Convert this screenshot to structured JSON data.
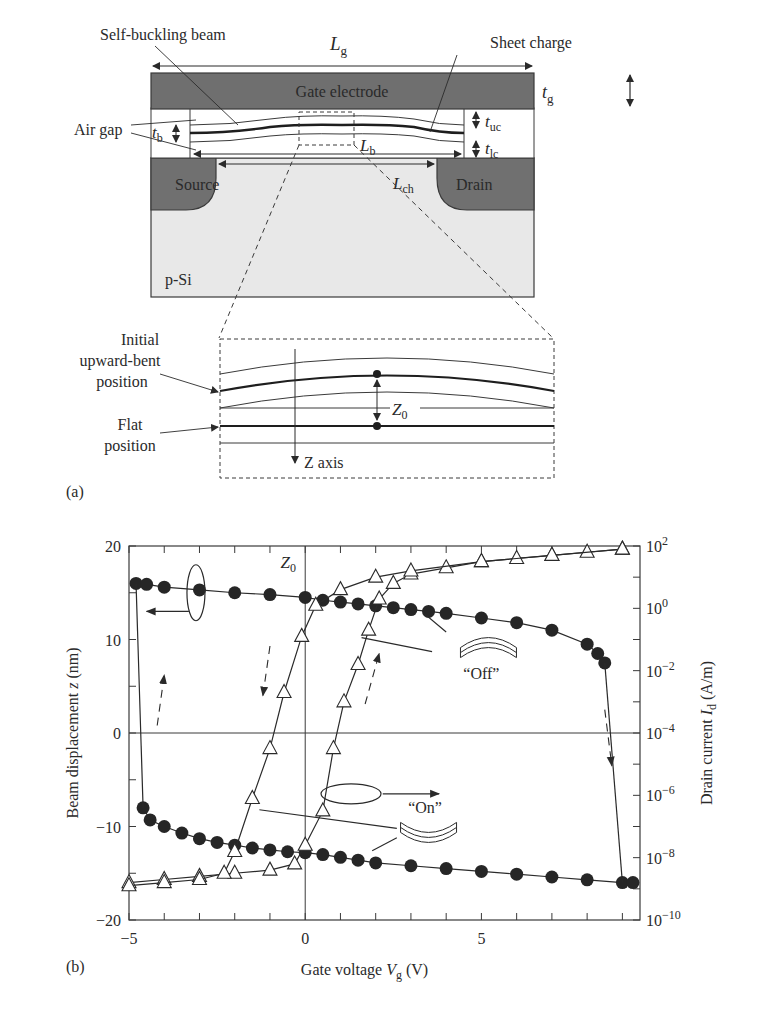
{
  "panel_a": {
    "label": "(a)",
    "labels": {
      "self_buckling_beam": "Self-buckling beam",
      "sheet_charge": "Sheet charge",
      "gate_electrode": "Gate electrode",
      "air_gap": "Air gap",
      "source": "Source",
      "drain": "Drain",
      "substrate": "p-Si",
      "Lg": "L",
      "Lg_sub": "g",
      "tg": "t",
      "tg_sub": "g",
      "tb": "t",
      "tb_sub": "b",
      "tuc": "t",
      "tuc_sub": "uc",
      "tlc": "t",
      "tlc_sub": "lc",
      "Lb": "L",
      "Lb_sub": "b",
      "Lch": "L",
      "Lch_sub": "ch"
    },
    "inset": {
      "initial_1": "Initial",
      "initial_2": "upward-bent",
      "initial_3": "position",
      "flat_1": "Flat",
      "flat_2": "position",
      "z0": "Z",
      "z0_sub": "0",
      "z_axis": "Z axis"
    },
    "colors": {
      "electrode": "#6f6f6f",
      "substrate": "#e6e6e6",
      "line": "#2a2a2a"
    }
  },
  "panel_b": {
    "label": "(b)",
    "annotations": {
      "z0": "Z",
      "z0_sub": "0",
      "off": "“Off”",
      "on": "“On”"
    }
  },
  "chart_data": {
    "type": "line",
    "title": "",
    "xlabel": "Gate voltage V_g (V)",
    "ylabel": "Beam displacement z (nm)",
    "y2label": "Drain current I_d (A/m)",
    "xlim": [
      -5,
      9.5
    ],
    "ylim": [
      -20,
      20
    ],
    "y2lim_log10": [
      -10,
      2
    ],
    "xticks": [
      "-5",
      "0",
      "5"
    ],
    "yticks": [
      "-20",
      "-10",
      "0",
      "10",
      "20"
    ],
    "y2ticks": [
      "10^-10",
      "10^-8",
      "10^-6",
      "10^-4",
      "10^-2",
      "10^0",
      "10^2"
    ],
    "grid": false,
    "reference_lines": [
      "x=0",
      "y=0"
    ],
    "series": [
      {
        "name": "Beam displacement (Off state, upper branch)",
        "axis": "left",
        "marker": "filled-circle",
        "x": [
          -4.8,
          -4.5,
          -4.0,
          -3.0,
          -2.0,
          -1.0,
          0.0,
          0.5,
          1.0,
          1.5,
          2.0,
          2.5,
          3.0,
          3.5,
          4.0,
          5.0,
          6.0,
          7.0,
          8.0,
          8.3,
          8.5
        ],
        "y": [
          16.0,
          15.9,
          15.6,
          15.3,
          15.0,
          14.8,
          14.5,
          14.2,
          14.0,
          13.8,
          13.6,
          13.4,
          13.2,
          13.0,
          12.8,
          12.3,
          11.8,
          11.0,
          9.5,
          8.5,
          7.5
        ]
      },
      {
        "name": "Beam displacement (On state, lower branch)",
        "axis": "left",
        "marker": "filled-circle",
        "x": [
          -4.6,
          -4.4,
          -4.0,
          -3.5,
          -3.0,
          -2.5,
          -2.0,
          -1.5,
          -1.0,
          -0.5,
          0.0,
          0.5,
          1.0,
          1.5,
          2.0,
          3.0,
          4.0,
          5.0,
          6.0,
          7.0,
          8.0,
          9.0,
          9.3
        ],
        "y": [
          -8.0,
          -9.3,
          -10.0,
          -10.7,
          -11.3,
          -11.7,
          -12.0,
          -12.3,
          -12.5,
          -12.7,
          -12.8,
          -13.0,
          -13.3,
          -13.6,
          -13.9,
          -14.2,
          -14.5,
          -14.8,
          -15.1,
          -15.4,
          -15.7,
          -16.0,
          -16.0
        ]
      },
      {
        "name": "Drain current (forward sweep)",
        "axis": "right",
        "marker": "open-triangle",
        "log10_y": true,
        "x": [
          -5.0,
          -4.0,
          -3.0,
          -2.0,
          -1.0,
          -0.3,
          0.0,
          0.5,
          0.8,
          1.1,
          1.5,
          1.8,
          2.1,
          2.5,
          3.0,
          4.0,
          5.0,
          6.0,
          7.0,
          8.0,
          9.0
        ],
        "y": [
          -8.8,
          -8.7,
          -8.6,
          -8.5,
          -8.4,
          -8.2,
          -7.6,
          -6.5,
          -4.5,
          -3.0,
          -1.8,
          -0.7,
          0.3,
          0.8,
          1.1,
          1.3,
          1.5,
          1.6,
          1.7,
          1.8,
          1.9
        ]
      },
      {
        "name": "Drain current (reverse sweep)",
        "axis": "right",
        "marker": "open-triangle",
        "log10_y": true,
        "x": [
          9.0,
          7.0,
          5.0,
          3.0,
          2.0,
          1.0,
          0.3,
          -0.1,
          -0.6,
          -1.0,
          -1.5,
          -2.0,
          -2.3,
          -3.0,
          -4.0,
          -5.0
        ],
        "y": [
          1.9,
          1.7,
          1.5,
          1.2,
          1.0,
          0.6,
          0.1,
          -0.9,
          -2.7,
          -4.5,
          -6.1,
          -7.8,
          -8.5,
          -8.7,
          -8.8,
          -8.9
        ]
      }
    ]
  }
}
